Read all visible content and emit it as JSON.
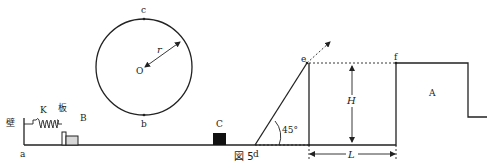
{
  "figure": {
    "caption": "図 5",
    "labels": {
      "wall": "壁",
      "spring": "K",
      "plate": "板",
      "block_b": "B",
      "point_a": "a",
      "point_b": "b",
      "point_c": "c",
      "center": "O",
      "radius": "r",
      "block_c": "C",
      "point_d": "d",
      "angle": "45°",
      "point_e": "e",
      "point_f": "f",
      "height": "H",
      "length": "L",
      "platform": "A"
    },
    "colors": {
      "line": "#222222",
      "block_c_fill": "#111111",
      "block_b_fill": "#d8d8d8"
    }
  }
}
